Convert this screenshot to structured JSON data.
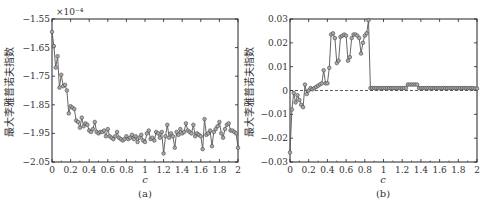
{
  "chart_data": [
    {
      "panel": "(a)",
      "type": "line",
      "title": "",
      "xlabel": "c",
      "ylabel": "最大李雅普诺夫指数",
      "y_multiplier": "×10⁻⁴",
      "xlim": [
        0,
        2
      ],
      "ylim": [
        -2.05,
        -1.55
      ],
      "xticks": [
        "0",
        "0.2",
        "0.4",
        "0.6",
        "0.8",
        "1",
        "1.2",
        "1.4",
        "1.6",
        "1.8",
        "2"
      ],
      "yticks": [
        "-1.55",
        "-1.65",
        "-1.75",
        "-1.85",
        "-1.95",
        "-2.05"
      ],
      "grid": false,
      "markers": "circle",
      "x": [
        0,
        0.02,
        0.04,
        0.06,
        0.08,
        0.1,
        0.12,
        0.14,
        0.16,
        0.18,
        0.2,
        0.22,
        0.24,
        0.26,
        0.28,
        0.3,
        0.32,
        0.34,
        0.36,
        0.38,
        0.4,
        0.42,
        0.44,
        0.46,
        0.48,
        0.5,
        0.52,
        0.54,
        0.56,
        0.58,
        0.6,
        0.62,
        0.64,
        0.66,
        0.68,
        0.7,
        0.72,
        0.74,
        0.76,
        0.78,
        0.8,
        0.82,
        0.84,
        0.86,
        0.88,
        0.9,
        0.92,
        0.94,
        0.96,
        0.98,
        1.0,
        1.02,
        1.04,
        1.06,
        1.08,
        1.1,
        1.12,
        1.14,
        1.16,
        1.18,
        1.2,
        1.22,
        1.24,
        1.26,
        1.28,
        1.3,
        1.32,
        1.34,
        1.36,
        1.38,
        1.4,
        1.42,
        1.44,
        1.46,
        1.48,
        1.5,
        1.52,
        1.54,
        1.56,
        1.58,
        1.6,
        1.62,
        1.64,
        1.66,
        1.68,
        1.7,
        1.72,
        1.74,
        1.76,
        1.78,
        1.8,
        1.82,
        1.84,
        1.86,
        1.88,
        1.9,
        1.92,
        1.94,
        1.96,
        1.98,
        2.0
      ],
      "values": [
        -1.595,
        -1.645,
        -1.72,
        -1.68,
        -1.79,
        -1.745,
        -1.785,
        -1.78,
        -1.8,
        -1.88,
        -1.855,
        -1.86,
        -1.865,
        -1.905,
        -1.91,
        -1.93,
        -1.895,
        -1.925,
        -1.915,
        -1.92,
        -1.94,
        -1.945,
        -1.935,
        -1.91,
        -1.945,
        -1.95,
        -1.945,
        -1.945,
        -1.94,
        -1.96,
        -1.935,
        -1.96,
        -1.965,
        -1.97,
        -1.96,
        -1.945,
        -1.965,
        -1.97,
        -1.975,
        -1.97,
        -1.96,
        -1.97,
        -1.965,
        -1.955,
        -1.97,
        -1.96,
        -1.98,
        -1.965,
        -1.955,
        -1.975,
        -1.98,
        -1.95,
        -1.94,
        -1.97,
        -1.965,
        -1.975,
        -1.945,
        -1.95,
        -1.965,
        -1.945,
        -2.02,
        -1.96,
        -1.92,
        -1.965,
        -1.95,
        -1.96,
        -2.0,
        -1.945,
        -1.955,
        -1.935,
        -1.95,
        -1.945,
        -1.915,
        -1.94,
        -1.945,
        -1.95,
        -1.92,
        -1.96,
        -1.95,
        -1.955,
        -1.96,
        -2.005,
        -1.9,
        -1.955,
        -1.95,
        -1.94,
        -1.995,
        -1.945,
        -1.935,
        -1.925,
        -1.91,
        -1.95,
        -1.965,
        -1.935,
        -1.92,
        -1.915,
        -1.94,
        -1.94,
        -1.945,
        -1.95,
        -2.0
      ]
    },
    {
      "panel": "(b)",
      "type": "line",
      "title": "",
      "xlabel": "c",
      "ylabel": "最大李雅普诺夫指数",
      "xlim": [
        0,
        2
      ],
      "ylim": [
        -0.03,
        0.03
      ],
      "xticks": [
        "0",
        "0.2",
        "0.4",
        "0.6",
        "0.8",
        "1",
        "1.2",
        "1.4",
        "1.6",
        "1.8",
        "2"
      ],
      "yticks": [
        "0.03",
        "0.02",
        "0.01",
        "0",
        "-0.01",
        "-0.02",
        "-0.03"
      ],
      "grid": false,
      "reference_line": {
        "y": 0,
        "style": "dashed"
      },
      "markers": "circle",
      "x": [
        0,
        0.02,
        0.04,
        0.06,
        0.08,
        0.1,
        0.12,
        0.14,
        0.16,
        0.18,
        0.2,
        0.22,
        0.24,
        0.26,
        0.28,
        0.3,
        0.32,
        0.34,
        0.36,
        0.38,
        0.4,
        0.42,
        0.44,
        0.46,
        0.48,
        0.5,
        0.52,
        0.54,
        0.56,
        0.58,
        0.6,
        0.62,
        0.64,
        0.66,
        0.68,
        0.7,
        0.72,
        0.74,
        0.76,
        0.78,
        0.8,
        0.82,
        0.84,
        0.86,
        0.88,
        0.9,
        0.92,
        0.94,
        0.96,
        0.98,
        1.0,
        1.02,
        1.04,
        1.06,
        1.08,
        1.1,
        1.12,
        1.14,
        1.16,
        1.18,
        1.2,
        1.22,
        1.24,
        1.26,
        1.28,
        1.3,
        1.32,
        1.34,
        1.36,
        1.38,
        1.4,
        1.42,
        1.44,
        1.46,
        1.48,
        1.5,
        1.52,
        1.54,
        1.56,
        1.58,
        1.6,
        1.62,
        1.64,
        1.66,
        1.68,
        1.7,
        1.72,
        1.74,
        1.76,
        1.78,
        1.8,
        1.82,
        1.84,
        1.86,
        1.88,
        1.9,
        1.92,
        1.94,
        1.96,
        1.98,
        2.0
      ],
      "values": [
        -0.026,
        -0.008,
        -0.001,
        -0.005,
        -0.002,
        -0.004,
        -0.006,
        -0.007,
        0.0025,
        -0.0015,
        0.0,
        0.001,
        0.0005,
        0.001,
        0.0015,
        0.002,
        0.0025,
        0.003,
        0.0085,
        0.003,
        0.003,
        0.0095,
        0.0235,
        0.024,
        0.022,
        0.0115,
        0.0125,
        0.0225,
        0.023,
        0.0235,
        0.023,
        0.0125,
        0.014,
        0.022,
        0.0235,
        0.0235,
        0.023,
        0.022,
        0.0155,
        0.02,
        0.023,
        0.024,
        0.0295,
        0.001,
        0.001,
        0.001,
        0.001,
        0.001,
        0.001,
        0.001,
        0.001,
        0.001,
        0.001,
        0.001,
        0.001,
        0.001,
        0.001,
        0.001,
        0.001,
        0.001,
        0.001,
        0.001,
        0.001,
        0.0025,
        0.0025,
        0.0025,
        0.0025,
        0.0025,
        0.0025,
        0.001,
        0.001,
        0.001,
        0.001,
        0.001,
        0.001,
        0.001,
        0.001,
        0.001,
        0.001,
        0.001,
        0.001,
        0.001,
        0.001,
        0.001,
        0.001,
        0.001,
        0.001,
        0.001,
        0.001,
        0.001,
        0.001,
        0.001,
        0.001,
        0.001,
        0.001,
        0.001,
        0.001,
        0.001,
        0.001,
        0.0008,
        0.0008
      ]
    }
  ],
  "panels": {
    "a": {
      "label": "(a)",
      "xlabel": "c",
      "ylabel": "最大李雅普诺夫指数",
      "multiplier": "×10⁻⁴"
    },
    "b": {
      "label": "(b)",
      "xlabel": "c",
      "ylabel": "最大李雅普诺夫指数"
    }
  },
  "colors": {
    "line": "#555555",
    "marker_fill": "#aaaaaa",
    "marker_stroke": "#444444",
    "axis": "#222222"
  }
}
